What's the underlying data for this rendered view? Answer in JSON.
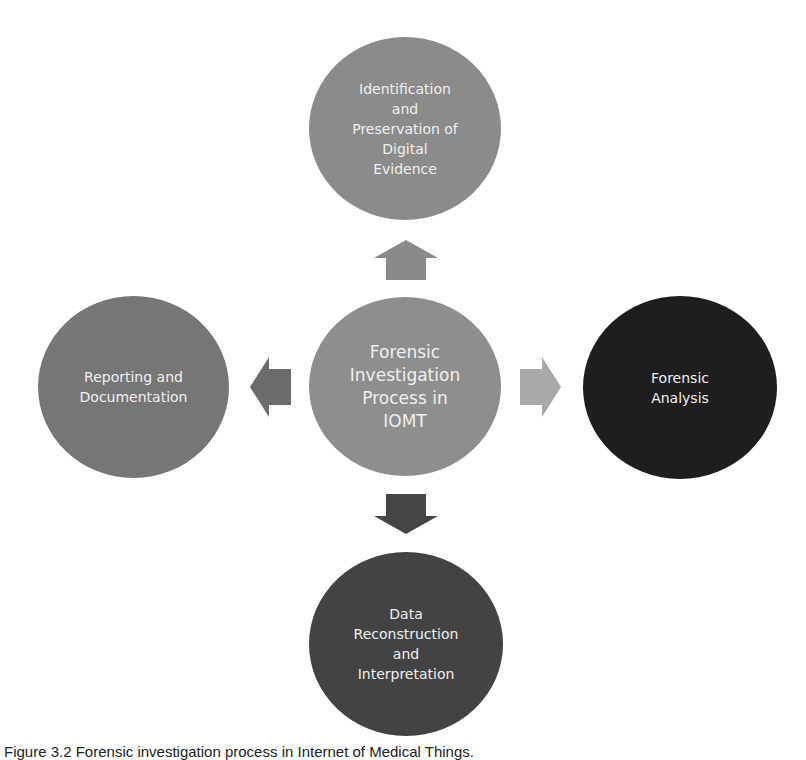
{
  "diagram": {
    "center": {
      "label": "Forensic\nInvestigation\nProcess in\nIOMT",
      "color": "#8e8e8e"
    },
    "top": {
      "label": "Identification\nand\nPreservation of\nDigital\nEvidence",
      "color": "#8b8b8b"
    },
    "left": {
      "label": "Reporting and\nDocumentation",
      "color": "#767676"
    },
    "right": {
      "label": "Forensic\nAnalysis",
      "color": "#1e1e1e"
    },
    "bottom": {
      "label": "Data\nReconstruction\nand\nInterpretation",
      "color": "#434343"
    },
    "arrows": {
      "up": {
        "icon": "arrow-up-icon",
        "color": "#8a8a8a"
      },
      "left": {
        "icon": "arrow-left-icon",
        "color": "#6c6c6c"
      },
      "right": {
        "icon": "arrow-right-icon",
        "color": "#a9a9a9"
      },
      "down": {
        "icon": "arrow-down-icon",
        "color": "#454545"
      }
    }
  },
  "caption": "Figure 3.2 Forensic investigation process in Internet of Medical Things."
}
